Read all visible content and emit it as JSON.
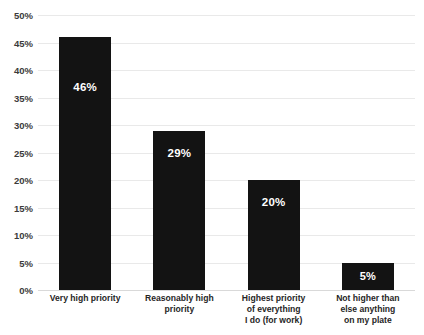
{
  "chart_data": {
    "type": "bar",
    "title": "",
    "xlabel": "",
    "ylabel": "",
    "ylim": [
      0,
      50
    ],
    "ytick_labels": [
      "50%",
      "45%",
      "40%",
      "35%",
      "30%",
      "25%",
      "20%",
      "15%",
      "10%",
      "5%",
      "0%"
    ],
    "ytick_values": [
      50,
      45,
      40,
      35,
      30,
      25,
      20,
      15,
      10,
      5,
      0
    ],
    "grid": true,
    "legend": "none",
    "categories": [
      "Very high priority",
      "Reasonably high priority",
      "Highest priority of everything I do (for work)",
      "Not higher than else anything on my plate"
    ],
    "category_lines": [
      [
        "Very high priority"
      ],
      [
        "Reasonably high",
        "priority"
      ],
      [
        "Highest priority",
        "of everything",
        "I do (for work)"
      ],
      [
        "Not higher than",
        "else anything",
        "on my plate"
      ]
    ],
    "values": [
      46,
      29,
      20,
      5
    ],
    "data_labels": [
      "46%",
      "29%",
      "20%",
      "5%"
    ],
    "bar_color": "#131313",
    "data_label_color": "#ffffff",
    "gridline_color": "#e9e9e9",
    "background_color": "#ffffff"
  }
}
